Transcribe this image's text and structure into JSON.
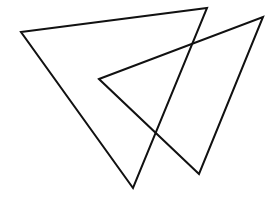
{
  "diagram": {
    "background": "#ffffff",
    "stroke_color": "#111111",
    "stroke_width": 2,
    "shapes": [
      {
        "name": "triangle-left",
        "points": "21,32 207,8 133,188"
      },
      {
        "name": "triangle-right",
        "points": "99,79 263,17 199,174"
      }
    ]
  }
}
